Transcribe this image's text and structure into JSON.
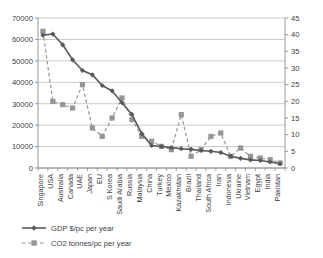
{
  "chart_data": {
    "type": "line",
    "title": "",
    "subtitle": "",
    "xlabel": "",
    "ylabel": "",
    "y2label": "",
    "grid": true,
    "legend_position": "bottom-left",
    "ylim": [
      0,
      70000
    ],
    "y2lim": [
      0,
      45
    ],
    "yticks": [
      "0",
      "10000",
      "20000",
      "30000",
      "40000",
      "50000",
      "60000",
      "70000"
    ],
    "ytick_values": [
      0,
      10000,
      20000,
      30000,
      40000,
      50000,
      60000,
      70000
    ],
    "y2ticks": [
      "0",
      "5",
      "10",
      "15",
      "20",
      "25",
      "30",
      "35",
      "40",
      "45"
    ],
    "y2tick_values": [
      0,
      5,
      10,
      15,
      20,
      25,
      30,
      35,
      40,
      45
    ],
    "categories": [
      "Singapore",
      "USA",
      "Australia",
      "Canada",
      "UAE",
      "Japan",
      "EU",
      "S Korea",
      "Saudi Arabia",
      "Russia",
      "Malaysia",
      "China",
      "Turkey",
      "Mexico",
      "Kazakhstan",
      "Brazil",
      "Thailand",
      "South Africa",
      "Iran",
      "Indonesia",
      "Ukraine",
      "Vietnam",
      "Egypt",
      "India",
      "Pakistan"
    ],
    "series": [
      {
        "name": "GDP $/pc per year",
        "axis": "left",
        "color": "#595959",
        "marker": "diamond",
        "linestyle": "solid",
        "values": [
          62000,
          62500,
          57500,
          50500,
          45500,
          43500,
          38500,
          36000,
          30500,
          25000,
          16000,
          10500,
          10000,
          9500,
          9000,
          8700,
          8200,
          7800,
          7200,
          5500,
          4500,
          3800,
          3500,
          2800,
          2000
        ]
      },
      {
        "name": "CO2 tonnes/pc per year",
        "axis": "right",
        "color": "#969696",
        "marker": "square",
        "linestyle": "dashed",
        "values": [
          41,
          20,
          19,
          18,
          25,
          12,
          9.5,
          15,
          21,
          14.5,
          9.5,
          8,
          6.5,
          5.5,
          16,
          3.5,
          5.5,
          9.5,
          10.5,
          3.5,
          6,
          3.5,
          3,
          2.5,
          1.5
        ]
      }
    ]
  },
  "legend": {
    "items": [
      {
        "label": "GDP $/pc per year"
      },
      {
        "label": "CO2 tonnes/pc per year"
      }
    ]
  }
}
